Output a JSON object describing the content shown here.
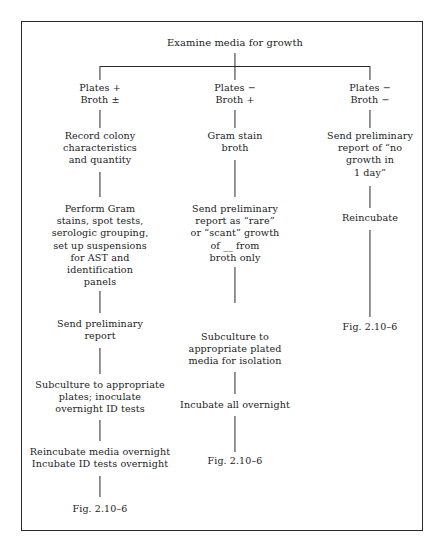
{
  "figure": {
    "root": "Examine media for growth",
    "branches": [
      {
        "id": "left",
        "label": "Plates +\nBroth ±",
        "steps": [
          "Record colony\ncharacteristics\nand quantity",
          "Perform Gram\nstains, spot tests,\nserologic grouping,\nset up suspensions\nfor AST and\nidentification\npanels",
          "Send preliminary\nreport",
          "Subculture to appropriate\nplates; inoculate\novernight ID tests",
          "Reincubate media overnight\nIncubate ID tests overnight"
        ],
        "figure_ref": "Fig. 2.10–6"
      },
      {
        "id": "middle",
        "label": "Plates −\nBroth +",
        "steps": [
          "Gram stain\nbroth",
          "Send preliminary\nreport as “rare”\nor “scant” growth\nof __ from\nbroth only",
          "Subculture to\nappropriate plated\nmedia for isolation",
          "Incubate all overnight"
        ],
        "figure_ref": "Fig. 2.10–6"
      },
      {
        "id": "right",
        "label": "Plates −\nBroth −",
        "steps": [
          "Send preliminary\nreport of “no\ngrowth in\n1 day”",
          "Reincubate"
        ],
        "figure_ref": "Fig. 2.10–6"
      }
    ],
    "colors": {
      "line": "#2a2a2a",
      "text": "#1b1b1b",
      "background": "#ffffff"
    }
  }
}
